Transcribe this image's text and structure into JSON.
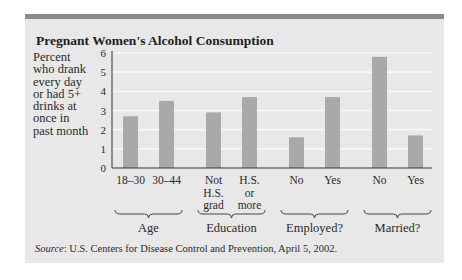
{
  "chart_data": {
    "type": "bar",
    "title": "Pregnant Women's Alcohol Consumption",
    "ylabel": "Percent who drank every day or had 5+ drinks at once in past month",
    "ylabel_lines": [
      "Percent",
      "who drank",
      "every day",
      "or had 5+",
      "drinks at",
      "once in",
      "past month"
    ],
    "xlabel": "",
    "ylim": [
      0,
      6
    ],
    "yticks": [
      0,
      1,
      2,
      3,
      4,
      5,
      6
    ],
    "grid": true,
    "groups": [
      {
        "name": "Age",
        "categories": [
          [
            "18–30"
          ],
          [
            "30–44"
          ]
        ],
        "values": [
          2.7,
          3.5
        ]
      },
      {
        "name": "Education",
        "categories": [
          [
            "Not",
            "H.S.",
            "grad"
          ],
          [
            "H.S.",
            "or",
            "more"
          ]
        ],
        "values": [
          2.9,
          3.7
        ]
      },
      {
        "name": "Employed?",
        "categories": [
          [
            "No"
          ],
          [
            "Yes"
          ]
        ],
        "values": [
          1.6,
          3.7
        ]
      },
      {
        "name": "Married?",
        "categories": [
          [
            "No"
          ],
          [
            "Yes"
          ]
        ],
        "values": [
          5.8,
          1.7
        ]
      }
    ],
    "colors": {
      "bar": "#a9a9a9",
      "background": "#e8e8e8",
      "grid": "#f7f7f7",
      "axis": "#333333",
      "topbar": "#8a8a8a"
    }
  },
  "source": {
    "label": "Source",
    "text": ": U.S. Centers for Disease Control and Prevention, April 5, 2002."
  }
}
